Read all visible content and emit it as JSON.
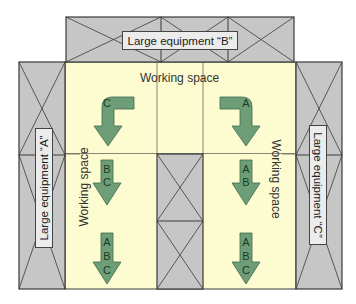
{
  "colors": {
    "working_space": "#fdfbd0",
    "equipment": "#c6c6c6",
    "outline": "#3a3a3a",
    "arrow_fill": "#6d9e78",
    "arrow_stroke": "#3f6b4a",
    "label_bg": "#ececec"
  },
  "equipment": {
    "top": {
      "label": "Large equipment “B”"
    },
    "left": {
      "label": "Large equipment “A”"
    },
    "right": {
      "label": "Large equipment “C”"
    }
  },
  "working_space": {
    "top_label": "Working space",
    "left_label": "Working space",
    "right_label": "Working space"
  },
  "arrows": {
    "top_left_curved": [
      "C"
    ],
    "top_right_curved": [
      "A"
    ],
    "mid_left": [
      "B",
      "C"
    ],
    "mid_right": [
      "A",
      "B"
    ],
    "bottom_left": [
      "A",
      "B",
      "C"
    ],
    "bottom_right": [
      "A",
      "B",
      "C"
    ]
  }
}
